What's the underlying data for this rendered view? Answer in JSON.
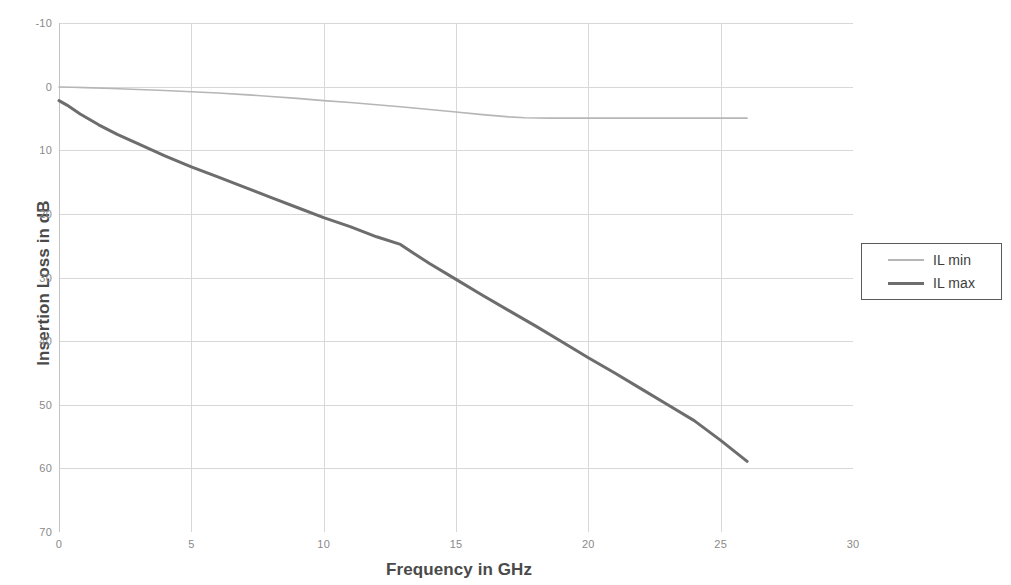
{
  "chart_data": {
    "type": "line",
    "title": "",
    "xlabel": "Frequency in GHz",
    "ylabel": "Insertion Loss in dB",
    "xlim": [
      0,
      30
    ],
    "ylim": [
      -10,
      70
    ],
    "y_inverted": true,
    "grid": true,
    "legend_position": "right",
    "xticks": [
      0,
      5,
      10,
      15,
      20,
      25,
      30
    ],
    "xtick_labels": [
      "0",
      "5",
      "10",
      "15",
      "20",
      "25",
      "30"
    ],
    "yticks": [
      -10,
      0,
      10,
      20,
      30,
      40,
      50,
      60,
      70
    ],
    "ytick_labels": [
      "-10",
      "0",
      "10",
      "20",
      "30",
      "40",
      "50",
      "60",
      "70"
    ],
    "series": [
      {
        "name": "IL min",
        "color": "#b6b6b6",
        "width": 1.6,
        "x": [
          0,
          0.5,
          1,
          2,
          3,
          4,
          5,
          6,
          7,
          8,
          9,
          10,
          11,
          12,
          13,
          14,
          15,
          16,
          17,
          17.6,
          18.5,
          20,
          22,
          24,
          26
        ],
        "y": [
          0.05,
          0.1,
          0.15,
          0.3,
          0.45,
          0.6,
          0.8,
          1.0,
          1.25,
          1.55,
          1.85,
          2.2,
          2.5,
          2.85,
          3.2,
          3.6,
          4.0,
          4.4,
          4.75,
          4.9,
          4.95,
          4.95,
          4.95,
          4.95,
          4.95
        ]
      },
      {
        "name": "IL max",
        "color": "#6d6d6d",
        "width": 3.0,
        "x": [
          0,
          0.3,
          0.8,
          1.5,
          2.2,
          3,
          4,
          5,
          6,
          7,
          8,
          9,
          10,
          11,
          12,
          12.9,
          13.4,
          14,
          15,
          16,
          17,
          18,
          19,
          20,
          21,
          22,
          23,
          24,
          25,
          26
        ],
        "y": [
          2.2,
          2.9,
          4.3,
          6.0,
          7.5,
          9.0,
          10.9,
          12.6,
          14.2,
          15.8,
          17.4,
          19.0,
          20.6,
          22.0,
          23.6,
          24.8,
          26.2,
          27.8,
          30.3,
          32.8,
          35.2,
          37.6,
          40.1,
          42.6,
          45.0,
          47.5,
          50.0,
          52.5,
          55.6,
          58.9
        ]
      }
    ]
  },
  "legend": {
    "entries": [
      {
        "label": "IL min"
      },
      {
        "label": "IL max"
      }
    ]
  }
}
